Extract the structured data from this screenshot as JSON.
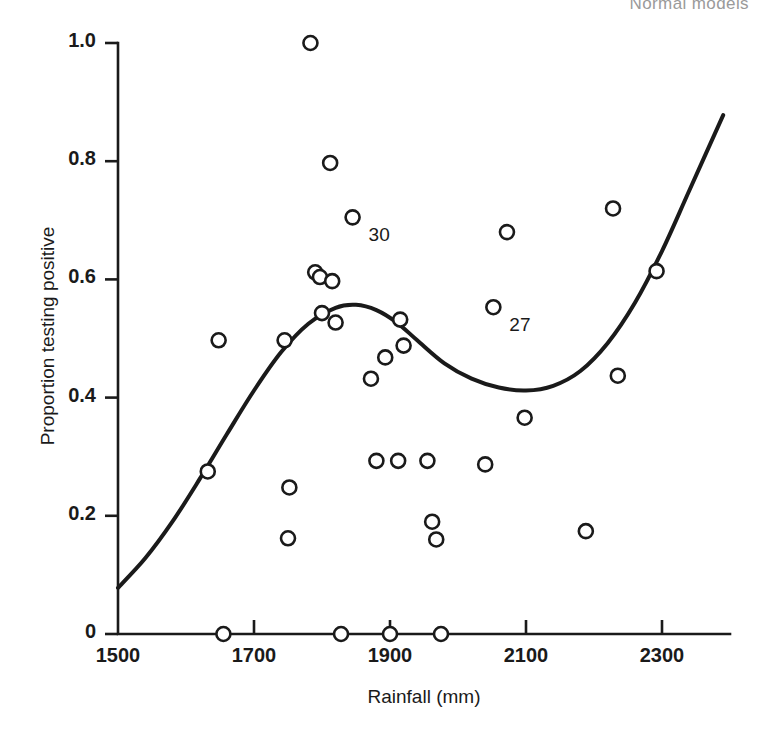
{
  "page": {
    "running_head": "Normal models"
  },
  "chart_data": {
    "type": "scatter",
    "title": "",
    "xlabel": "Rainfall (mm)",
    "ylabel": "Proportion testing positive",
    "xlim": [
      1500,
      2400
    ],
    "ylim": [
      0,
      1.0
    ],
    "grid": false,
    "legend": null,
    "xticks": [
      1500,
      1700,
      1900,
      2100,
      2300
    ],
    "xtick_labels": [
      "1500",
      "1700",
      "1900",
      "2100",
      "2300"
    ],
    "yticks": [
      0,
      0.2,
      0.4,
      0.6,
      0.8,
      1.0
    ],
    "ytick_labels": [
      "0",
      "0.2",
      "0.4",
      "0.6",
      "0.8",
      "1.0"
    ],
    "marker": "open-circle",
    "points": [
      {
        "x": 1648,
        "y": 0.497
      },
      {
        "x": 1632,
        "y": 0.275
      },
      {
        "x": 1655,
        "y": 0.0
      },
      {
        "x": 1745,
        "y": 0.497
      },
      {
        "x": 1752,
        "y": 0.248
      },
      {
        "x": 1750,
        "y": 0.162
      },
      {
        "x": 1783,
        "y": 1.0
      },
      {
        "x": 1790,
        "y": 0.612
      },
      {
        "x": 1797,
        "y": 0.604
      },
      {
        "x": 1800,
        "y": 0.543
      },
      {
        "x": 1812,
        "y": 0.797
      },
      {
        "x": 1815,
        "y": 0.597
      },
      {
        "x": 1820,
        "y": 0.527
      },
      {
        "x": 1828,
        "y": 0.0
      },
      {
        "x": 1845,
        "y": 0.705
      },
      {
        "x": 1872,
        "y": 0.432
      },
      {
        "x": 1880,
        "y": 0.293
      },
      {
        "x": 1893,
        "y": 0.468
      },
      {
        "x": 1900,
        "y": 0.0
      },
      {
        "x": 1912,
        "y": 0.293
      },
      {
        "x": 1915,
        "y": 0.532
      },
      {
        "x": 1920,
        "y": 0.488
      },
      {
        "x": 1955,
        "y": 0.293
      },
      {
        "x": 1962,
        "y": 0.19
      },
      {
        "x": 1968,
        "y": 0.16
      },
      {
        "x": 1975,
        "y": 0.0
      },
      {
        "x": 2040,
        "y": 0.287
      },
      {
        "x": 2052,
        "y": 0.553
      },
      {
        "x": 2072,
        "y": 0.68
      },
      {
        "x": 2098,
        "y": 0.366
      },
      {
        "x": 2188,
        "y": 0.174
      },
      {
        "x": 2228,
        "y": 0.72
      },
      {
        "x": 2235,
        "y": 0.437
      },
      {
        "x": 2292,
        "y": 0.614
      }
    ],
    "annotations": [
      {
        "label": "30",
        "x": 1845,
        "y": 0.705,
        "dx": 16,
        "dy": 20
      },
      {
        "label": "27",
        "x": 2052,
        "y": 0.553,
        "dx": 16,
        "dy": 20
      }
    ],
    "fitted_curve": {
      "name": "smoothed fit",
      "description": "non-parametric smooth curve fitted to the scatter",
      "points": [
        {
          "x": 1500,
          "y": 0.078
        },
        {
          "x": 1540,
          "y": 0.128
        },
        {
          "x": 1580,
          "y": 0.19
        },
        {
          "x": 1620,
          "y": 0.262
        },
        {
          "x": 1660,
          "y": 0.338
        },
        {
          "x": 1700,
          "y": 0.412
        },
        {
          "x": 1740,
          "y": 0.477
        },
        {
          "x": 1780,
          "y": 0.525
        },
        {
          "x": 1820,
          "y": 0.552
        },
        {
          "x": 1850,
          "y": 0.557
        },
        {
          "x": 1880,
          "y": 0.548
        },
        {
          "x": 1910,
          "y": 0.527
        },
        {
          "x": 1940,
          "y": 0.497
        },
        {
          "x": 1980,
          "y": 0.458
        },
        {
          "x": 2020,
          "y": 0.432
        },
        {
          "x": 2060,
          "y": 0.417
        },
        {
          "x": 2100,
          "y": 0.412
        },
        {
          "x": 2140,
          "y": 0.42
        },
        {
          "x": 2180,
          "y": 0.445
        },
        {
          "x": 2220,
          "y": 0.492
        },
        {
          "x": 2260,
          "y": 0.56
        },
        {
          "x": 2300,
          "y": 0.648
        },
        {
          "x": 2340,
          "y": 0.75
        },
        {
          "x": 2390,
          "y": 0.878
        }
      ]
    },
    "axis_pixel_calibration": {
      "x0_px": 118,
      "x0_value": 1500,
      "x1_px": 662,
      "x1_value": 2300,
      "y0_px": 634,
      "y0_value": 0,
      "y1_px": 43,
      "y1_value": 1.0
    },
    "style": {
      "ink": "#1a1a1a",
      "background": "#ffffff",
      "marker_radius_px": 7,
      "curve_width_px": 4
    }
  }
}
